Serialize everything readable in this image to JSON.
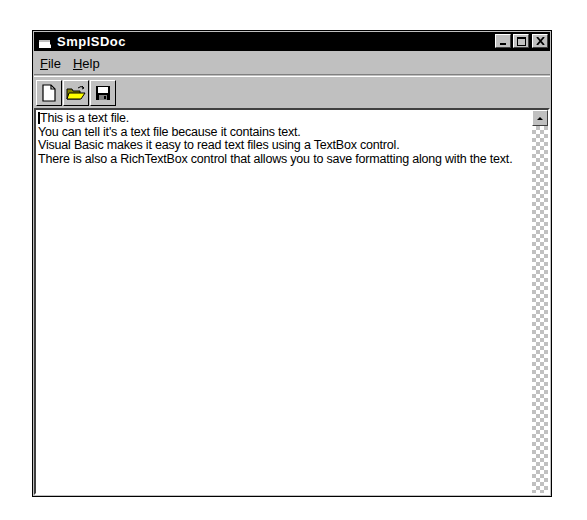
{
  "window": {
    "title": "SmplSDoc",
    "controls": {
      "minimize_label": "_",
      "maximize_label": "□",
      "close_label": "✕"
    }
  },
  "menu": {
    "items": [
      {
        "label": "File",
        "accel": "F",
        "rest": "ile"
      },
      {
        "label": "Help",
        "accel": "H",
        "rest": "elp"
      }
    ]
  },
  "toolbar": {
    "buttons": [
      {
        "name": "new",
        "icon": "new-document-icon"
      },
      {
        "name": "open",
        "icon": "open-folder-icon"
      },
      {
        "name": "save",
        "icon": "floppy-disk-icon"
      }
    ]
  },
  "document": {
    "lines": [
      "This is a text file.",
      "You can tell it's a text file because it contains text.",
      "Visual Basic makes it easy to read text files using a TextBox control.",
      "There is also a RichTextBox control that allows you to save formatting along with the text."
    ]
  }
}
